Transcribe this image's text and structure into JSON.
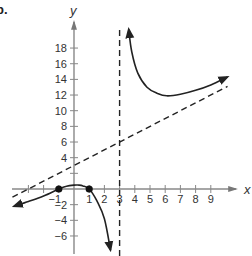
{
  "problem_label": "b.",
  "chart_data": {
    "type": "line",
    "title": "",
    "xlabel": "x",
    "ylabel": "y",
    "xlim": [
      -4,
      10.5
    ],
    "ylim": [
      -8,
      21
    ],
    "grid": false,
    "legend": null,
    "x_ticks": [
      -3,
      -2,
      -1,
      1,
      2,
      3,
      4,
      5,
      6,
      7,
      8,
      9
    ],
    "x_tick_labels": [
      "",
      "",
      "-1",
      "1",
      "2",
      "3",
      "4",
      "5",
      "6",
      "7",
      "8",
      "9"
    ],
    "y_ticks": [
      -6,
      -4,
      -2,
      2,
      4,
      6,
      8,
      10,
      12,
      14,
      16,
      18
    ],
    "y_tick_labels": [
      "-6",
      "-4",
      "-2",
      "",
      "4",
      "6",
      "8",
      "10",
      "12",
      "14",
      "16",
      "18"
    ],
    "asymptotes": [
      {
        "type": "vertical",
        "x": 3,
        "style": "dashed"
      },
      {
        "type": "oblique",
        "equation": "y = x + 3",
        "slope": 1,
        "intercept": 3,
        "style": "dashed"
      }
    ],
    "points": [
      {
        "x": -1,
        "y": 0,
        "marker": "filled-circle"
      },
      {
        "x": 1,
        "y": 0,
        "marker": "filled-circle"
      }
    ],
    "series": [
      {
        "name": "left-branch",
        "x": [
          -3.95,
          -3,
          -2,
          -1,
          -0.5,
          0,
          0.3,
          0.6,
          1,
          1.5,
          2,
          2.4
        ],
        "y": [
          -2.2,
          -1.6,
          -0.9,
          0,
          0.35,
          0.5,
          0.5,
          0.4,
          0,
          -1.5,
          -3.8,
          -7.8
        ],
        "arrows": [
          "start",
          "end"
        ]
      },
      {
        "name": "right-branch",
        "x": [
          3.6,
          3.8,
          4.2,
          4.8,
          5.5,
          6.1,
          7,
          8,
          9,
          10.1
        ],
        "y": [
          20.4,
          17.5,
          14.8,
          13,
          12.2,
          11.9,
          12.1,
          12.6,
          13.3,
          14.3
        ],
        "arrows": [
          "start",
          "end"
        ]
      }
    ]
  }
}
